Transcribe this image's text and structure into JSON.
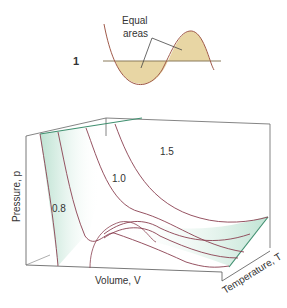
{
  "inset": {
    "marker": "1",
    "annotation_line1": "Equal",
    "annotation_line2": "areas",
    "fill_color": "#e8d6a4",
    "curve_color": "#a05a4a"
  },
  "surface": {
    "isotherm_labels": [
      "0.8",
      "1.0",
      "1.5"
    ],
    "axis_pressure": "Pressure, p",
    "axis_volume": "Volume, V",
    "axis_temperature": "Temperature, T",
    "surface_tint": "#cdeadf",
    "edge_color": "#3f8f6f",
    "curve_color": "#8a4050",
    "box_color": "#555555"
  }
}
